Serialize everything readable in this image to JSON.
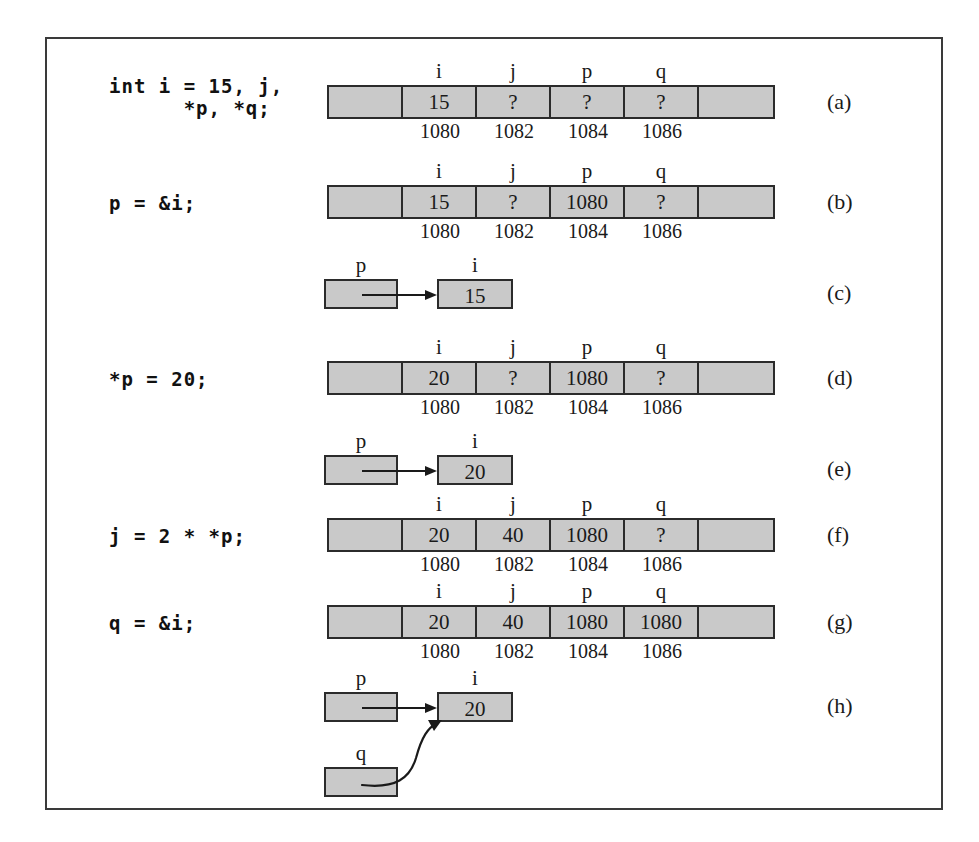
{
  "figure": {
    "kind": "c-pointer-memory-diagram",
    "memory_columns": [
      "i",
      "j",
      "p",
      "q"
    ],
    "addresses": [
      "1080",
      "1082",
      "1084",
      "1086"
    ],
    "panels": [
      {
        "letter": "(a)",
        "type": "memory",
        "code": "int i = 15, j,\n      *p, *q;",
        "cells": [
          "",
          "15",
          "?",
          "?",
          "?",
          ""
        ]
      },
      {
        "letter": "(b)",
        "type": "memory",
        "code": "p = &i;",
        "cells": [
          "",
          "15",
          "?",
          "1080",
          "?",
          ""
        ]
      },
      {
        "letter": "(c)",
        "type": "pointer",
        "code": "",
        "source_label": "p",
        "target_label": "i",
        "target_value": "15",
        "second_label": "",
        "second_value": ""
      },
      {
        "letter": "(d)",
        "type": "memory",
        "code": "*p = 20;",
        "cells": [
          "",
          "20",
          "?",
          "1080",
          "?",
          ""
        ]
      },
      {
        "letter": "(e)",
        "type": "pointer",
        "code": "",
        "source_label": "p",
        "target_label": "i",
        "target_value": "20",
        "second_label": "",
        "second_value": ""
      },
      {
        "letter": "(f)",
        "type": "memory",
        "code": "j = 2 * *p;",
        "cells": [
          "",
          "20",
          "40",
          "1080",
          "?",
          ""
        ]
      },
      {
        "letter": "(g)",
        "type": "memory",
        "code": "q = &i;",
        "cells": [
          "",
          "20",
          "40",
          "1080",
          "1080",
          ""
        ]
      },
      {
        "letter": "(h)",
        "type": "pointer-two",
        "code": "",
        "source_label": "p",
        "target_label": "i",
        "target_value": "20",
        "second_label": "q",
        "second_value": ""
      }
    ]
  },
  "colors": {
    "cell_fill": "#c9c9c9",
    "stroke": "#2b2b2b",
    "frame": "#3a3a3a",
    "text": "#1a1a1a"
  }
}
